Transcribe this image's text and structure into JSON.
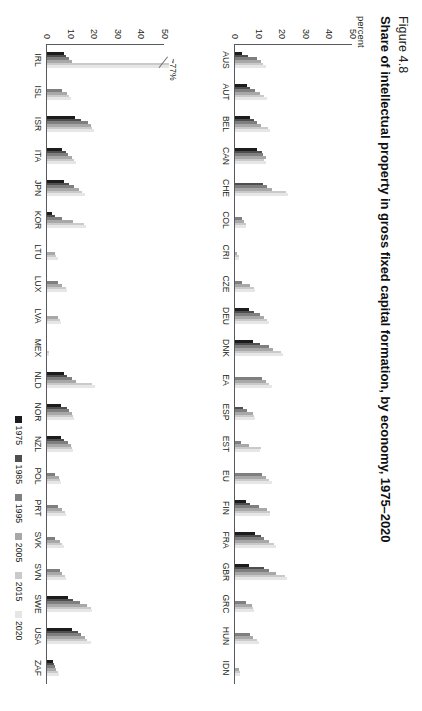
{
  "figure": {
    "number": "Figure 4.8",
    "title": "Share of intellectual property in gross fixed capital formation, by economy, 1975–2020",
    "unit_label": "percent"
  },
  "legend": {
    "position": "bottom-right",
    "items": [
      {
        "label": "1975",
        "color": "#1c1c1c"
      },
      {
        "label": "1985",
        "color": "#4f4f4f"
      },
      {
        "label": "1995",
        "color": "#7f7f7f"
      },
      {
        "label": "2005",
        "color": "#a8a8a8"
      },
      {
        "label": "2015",
        "color": "#cacaca"
      },
      {
        "label": "2020",
        "color": "#e6e6e6"
      }
    ]
  },
  "axis": {
    "ticks": [
      "0",
      "10",
      "20",
      "30",
      "40",
      "50"
    ],
    "ymin": 0,
    "ymax": 50
  },
  "annotations": [
    {
      "text": "~77%",
      "panel": 1,
      "category": "IRL"
    }
  ],
  "chart_data": {
    "type": "bar",
    "title": "Share of intellectual property in gross fixed capital formation, by economy, 1975–2020",
    "xlabel": "",
    "ylabel": "percent",
    "ylim": [
      0,
      50
    ],
    "grid": false,
    "legend_position": "bottom-right",
    "series_names": [
      "1975",
      "1985",
      "1995",
      "2005",
      "2015",
      "2020"
    ],
    "panels": [
      {
        "name": "panel-top",
        "categories": [
          "AUS",
          "AUT",
          "BEL",
          "CAN",
          "CHE",
          "COL",
          "CRI",
          "CZE",
          "DEU",
          "DNK",
          "EA",
          "ESP",
          "EST",
          "EU",
          "FIN",
          "FRA",
          "GBR",
          "GRC",
          "HUN",
          "IDN"
        ],
        "series": [
          {
            "name": "1975",
            "values": [
              3.0,
              5.0,
              6.5,
              9.5,
              null,
              null,
              null,
              null,
              6.0,
              7.5,
              null,
              null,
              null,
              null,
              4.5,
              8.5,
              6.0,
              null,
              null,
              null
            ]
          },
          {
            "name": "1985",
            "values": [
              5.5,
              6.5,
              8.0,
              11.5,
              12.0,
              null,
              null,
              null,
              8.0,
              10.5,
              null,
              3.5,
              null,
              null,
              6.5,
              11.0,
              12.5,
              null,
              null,
              null
            ]
          },
          {
            "name": "1995",
            "values": [
              9.5,
              8.5,
              9.5,
              12.0,
              13.5,
              3.0,
              null,
              3.0,
              10.5,
              14.5,
              11.5,
              5.0,
              2.5,
              11.5,
              10.0,
              12.5,
              14.5,
              4.5,
              6.5,
              null
            ]
          },
          {
            "name": "2005",
            "values": [
              11.0,
              10.5,
              11.0,
              13.0,
              15.5,
              4.0,
              1.0,
              6.5,
              12.5,
              16.0,
              13.0,
              7.5,
              6.0,
              13.0,
              13.5,
              14.5,
              17.5,
              7.0,
              7.5,
              1.5
            ]
          },
          {
            "name": "2015",
            "values": [
              12.0,
              12.5,
              14.0,
              12.5,
              21.5,
              4.5,
              1.5,
              8.0,
              13.5,
              19.5,
              14.5,
              8.0,
              11.0,
              14.5,
              15.0,
              16.5,
              21.0,
              7.5,
              9.5,
              2.0
            ]
          },
          {
            "name": "2020",
            "values": [
              13.0,
              13.5,
              15.0,
              13.0,
              22.5,
              4.5,
              1.5,
              8.5,
              14.5,
              20.5,
              15.5,
              8.5,
              10.5,
              15.5,
              15.0,
              17.5,
              22.0,
              8.0,
              10.0,
              2.0
            ]
          }
        ]
      },
      {
        "name": "panel-bottom",
        "categories": [
          "IRL",
          "ISL",
          "ISR",
          "ITA",
          "JPN",
          "KOR",
          "LTU",
          "LUX",
          "LVA",
          "MEX",
          "NLD",
          "NOR",
          "NZL",
          "POL",
          "PRT",
          "SVK",
          "SVN",
          "SWE",
          "USA",
          "ZAF"
        ],
        "series": [
          {
            "name": "1975",
            "values": [
              7.0,
              null,
              12.0,
              6.5,
              7.0,
              2.0,
              null,
              null,
              null,
              null,
              7.0,
              6.0,
              6.0,
              null,
              null,
              null,
              null,
              9.0,
              10.5,
              2.5
            ]
          },
          {
            "name": "1985",
            "values": [
              8.0,
              null,
              14.5,
              8.0,
              9.5,
              3.5,
              null,
              null,
              null,
              null,
              8.5,
              8.5,
              7.0,
              null,
              null,
              null,
              null,
              11.0,
              13.0,
              3.0
            ]
          },
          {
            "name": "1995",
            "values": [
              9.5,
              6.5,
              17.5,
              9.0,
              11.5,
              6.5,
              null,
              4.5,
              null,
              null,
              10.5,
              9.5,
              9.0,
              3.5,
              4.5,
              3.5,
              5.5,
              14.0,
              14.5,
              3.5
            ]
          },
          {
            "name": "2005",
            "values": [
              10.5,
              8.5,
              18.5,
              10.5,
              13.5,
              11.0,
              3.5,
              6.5,
              4.5,
              null,
              12.5,
              10.5,
              10.0,
              5.0,
              6.5,
              5.5,
              6.5,
              17.0,
              16.0,
              4.0
            ]
          },
          {
            "name": "2015",
            "values": [
              58.0,
              9.5,
              19.0,
              11.5,
              15.0,
              15.5,
              4.0,
              8.0,
              5.5,
              1.0,
              19.0,
              11.0,
              10.5,
              5.5,
              7.5,
              6.5,
              7.5,
              18.5,
              17.0,
              4.5
            ]
          },
          {
            "name": "2020",
            "values": [
              62.0,
              10.0,
              20.0,
              12.5,
              16.0,
              16.5,
              4.5,
              8.5,
              6.0,
              1.0,
              20.5,
              11.5,
              11.0,
              6.0,
              8.0,
              7.0,
              8.0,
              19.0,
              18.5,
              5.0
            ]
          }
        ]
      }
    ]
  }
}
